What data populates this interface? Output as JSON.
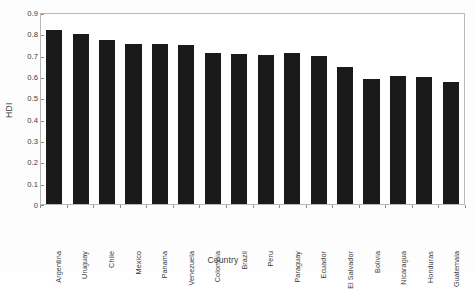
{
  "chart_data": {
    "type": "bar",
    "title": "",
    "xlabel": "Country",
    "ylabel": "HDI",
    "ylim": [
      0,
      0.9
    ],
    "ytick_step": 0.1,
    "grid": false,
    "legend": "none",
    "bar_color": "#1a1a1a",
    "frame_color": "#b9b9b9",
    "background": "#ffffff",
    "ytick_labels": [
      "0.9",
      "0.8",
      "0.7",
      "0.6",
      "0.5",
      "0.4",
      "0.3",
      "0.2",
      "0.1",
      "0"
    ],
    "ytick_values": [
      0.9,
      0.8,
      0.7,
      0.6,
      0.5,
      0.4,
      0.3,
      0.2,
      0.1,
      0
    ],
    "categories": [
      "Argentina",
      "Uruguay",
      "Chile",
      "Mexico",
      "Panama",
      "Venezuela",
      "Colombia",
      "Brazil",
      "Peru",
      "Paraguay",
      "Ecuador",
      "El Salvador",
      "Bolivia",
      "Nicaragua",
      "Honduras",
      "Guatemala"
    ],
    "values": [
      0.815,
      0.795,
      0.77,
      0.75,
      0.75,
      0.745,
      0.71,
      0.705,
      0.7,
      0.71,
      0.695,
      0.64,
      0.585,
      0.6,
      0.595,
      0.57
    ]
  }
}
